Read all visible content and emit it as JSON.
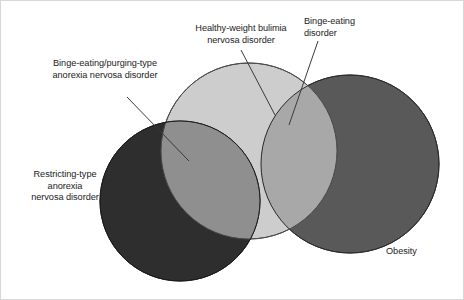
{
  "figure": {
    "type": "venn-diagram",
    "background_color": "#ffffff",
    "border_color": "#d8d8d8",
    "text_color": "#1b1b1b",
    "leader_line_color": "#3a3a3a"
  },
  "sets": [
    {
      "id": "restricting-anorexia",
      "label": "Restricting-type\nanorexia\nnervosa disorder",
      "fill": "#2e2e2e",
      "stroke": "#1a1a1a",
      "center": [
        179,
        200
      ],
      "radius": 80
    },
    {
      "id": "healthy-weight-bulimia",
      "label": "Healthy-weight bulimia\nnervosa disorder",
      "fill": "#c9c9c9",
      "stroke": "#4a4a4a",
      "center": [
        248,
        150
      ],
      "radius": 88
    },
    {
      "id": "obesity",
      "label": "Obesity",
      "fill": "#595959",
      "stroke": "#2b2b2b",
      "center": [
        349,
        163
      ],
      "radius": 89
    }
  ],
  "intersections": [
    {
      "id": "binge-purging-anorexia",
      "label": "Binge-eating/purging-type\nanorexia nervosa disorder",
      "fill": "#8f8f8f",
      "between": [
        "restricting-anorexia",
        "healthy-weight-bulimia"
      ]
    },
    {
      "id": "binge-eating-disorder",
      "label": "Binge-eating\ndisorder",
      "fill": "#a8a8a8",
      "between": [
        "healthy-weight-bulimia",
        "obesity"
      ]
    }
  ],
  "labels": {
    "binge_purging_anorexia": "Binge-eating/purging-type\nanorexia nervosa disorder",
    "healthy_weight_bulimia": "Healthy-weight bulimia\nnervosa disorder",
    "binge_eating_disorder": "Binge-eating\ndisorder",
    "restricting_anorexia": "Restricting-type\nanorexia\nnervosa disorder",
    "obesity": "Obesity"
  },
  "leader_lines": [
    {
      "id": "leader-binge-purging",
      "from": [
        126,
        96
      ],
      "to": [
        188,
        160
      ]
    },
    {
      "id": "leader-bulimia",
      "from": [
        240,
        49
      ],
      "to": [
        274,
        114
      ]
    },
    {
      "id": "leader-binge-eating",
      "from": [
        317,
        40
      ],
      "to": [
        288,
        124
      ]
    }
  ]
}
